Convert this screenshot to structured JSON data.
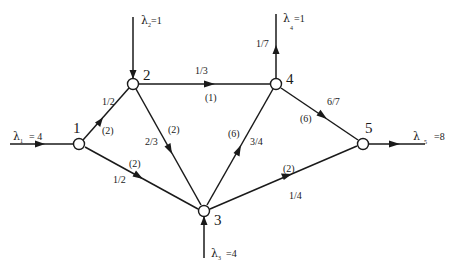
{
  "diagram": {
    "colors": {
      "stroke": "#1a1a1a",
      "background": "#ffffff",
      "node_fill": "#ffffff"
    },
    "nodes": [
      {
        "id": "1",
        "label": "1",
        "x": 79,
        "y": 144
      },
      {
        "id": "2",
        "label": "2",
        "x": 133,
        "y": 84
      },
      {
        "id": "3",
        "label": "3",
        "x": 204,
        "y": 211
      },
      {
        "id": "4",
        "label": "4",
        "x": 276,
        "y": 84
      },
      {
        "id": "5",
        "label": "5",
        "x": 363,
        "y": 144
      }
    ],
    "edges": [
      {
        "from": "1",
        "to": "2",
        "probability": "1/2",
        "capacity": "(2)"
      },
      {
        "from": "1",
        "to": "3",
        "probability": "1/2",
        "capacity": "(2)"
      },
      {
        "from": "2",
        "to": "4",
        "probability": "1/3",
        "capacity": "(1)"
      },
      {
        "from": "2",
        "to": "3",
        "probability": "2/3",
        "capacity": "(2)"
      },
      {
        "from": "3",
        "to": "4",
        "probability": "3/4",
        "capacity": "(6)"
      },
      {
        "from": "3",
        "to": "5",
        "probability": "1/4",
        "capacity": "(2)"
      },
      {
        "from": "4",
        "to": "5",
        "probability": "6/7",
        "capacity": "(6)"
      },
      {
        "from": "4",
        "to": "out",
        "probability": "1/7",
        "capacity": ""
      }
    ],
    "external_flows": [
      {
        "node": "1",
        "direction": "in",
        "symbol": "λ",
        "subscript": "1",
        "value": "= 4"
      },
      {
        "node": "2",
        "direction": "in",
        "symbol": "λ",
        "subscript": "2",
        "value": "=1"
      },
      {
        "node": "3",
        "direction": "in",
        "symbol": "λ",
        "subscript": "3",
        "value": "=4"
      },
      {
        "node": "4",
        "direction": "out",
        "symbol": "λ",
        "subscript": "4",
        "value": "=1"
      },
      {
        "node": "5",
        "direction": "out",
        "symbol": "λ",
        "subscript": "5",
        "value": "=8"
      }
    ]
  }
}
